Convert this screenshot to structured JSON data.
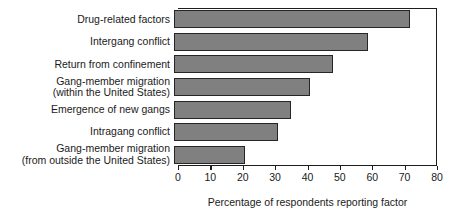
{
  "chart_data": {
    "type": "bar",
    "orientation": "horizontal",
    "title": "",
    "xlabel": "Percentage of respondents reporting factor",
    "ylabel": "",
    "xlim": [
      0,
      80
    ],
    "xticks": [
      0,
      10,
      20,
      30,
      40,
      50,
      60,
      70,
      80
    ],
    "grid": false,
    "legend": false,
    "bar_color": "#808080",
    "bar_edge_color": "#262626",
    "categories": [
      "Drug-related factors",
      "Intergang conflict",
      "Return from confinement",
      "Gang-member migration\n(within the United States)",
      "Emergence of new gangs",
      "Intragang conflict",
      "Gang-member migration\n(from outside the United States)"
    ],
    "values": [
      73,
      60,
      49,
      42,
      36,
      32,
      22
    ]
  }
}
